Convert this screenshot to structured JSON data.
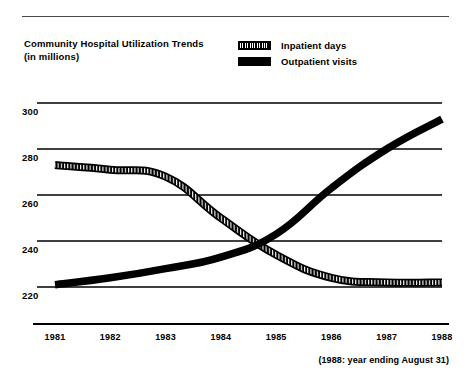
{
  "header": {
    "title_line1": "Community Hospital Utilization Trends",
    "title_line2": "(in millions)"
  },
  "legend": {
    "items": [
      {
        "label": "Inpatient days",
        "style": "hatched",
        "color": "#000000"
      },
      {
        "label": "Outpatient visits",
        "style": "solid",
        "color": "#000000"
      }
    ]
  },
  "footnote": "(1988: year ending August 31)",
  "chart_data": {
    "type": "line",
    "title": "Community Hospital Utilization Trends",
    "subtitle": "(in millions)",
    "xlabel": "",
    "ylabel": "",
    "ylim": [
      210,
      305
    ],
    "xlim": [
      "1981",
      "1988"
    ],
    "grid": true,
    "legend_position": "top-right",
    "categories": [
      "1981",
      "1982",
      "1983",
      "1984",
      "1985",
      "1986",
      "1987",
      "1988"
    ],
    "yticks": [
      220,
      240,
      260,
      280,
      300
    ],
    "series": [
      {
        "name": "Inpatient days",
        "style": "hatched",
        "color": "#000000",
        "values": [
          273,
          271,
          268,
          250,
          234,
          224,
          222,
          222
        ]
      },
      {
        "name": "Outpatient visits",
        "style": "solid",
        "color": "#000000",
        "values": [
          221,
          224,
          228,
          233,
          243,
          263,
          280,
          293
        ]
      }
    ],
    "annotations": [
      "(1988: year ending August 31)"
    ]
  }
}
